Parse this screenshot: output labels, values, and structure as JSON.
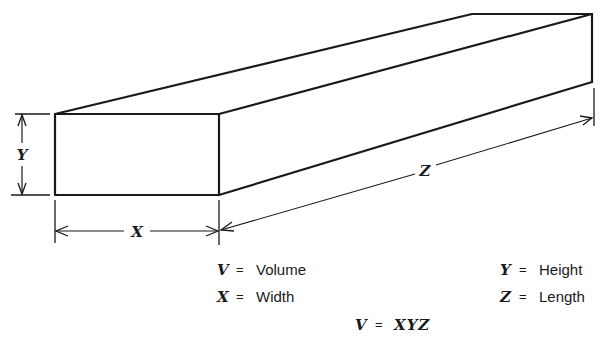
{
  "diagram": {
    "type": "isometric-rectangular-bar",
    "line_color": "#1a1a1a",
    "background": "#ffffff",
    "dimensions": {
      "width_label": "X",
      "height_label": "Y",
      "length_label": "Z"
    }
  },
  "legend": {
    "items": [
      {
        "symbol": "V",
        "equals": "=",
        "meaning": "Volume"
      },
      {
        "symbol": "X",
        "equals": "=",
        "meaning": "Width"
      },
      {
        "symbol": "Y",
        "equals": "=",
        "meaning": "Height"
      },
      {
        "symbol": "Z",
        "equals": "=",
        "meaning": "Length"
      }
    ],
    "formula": {
      "lhs": "V",
      "equals": "=",
      "rhs": "XYZ"
    }
  }
}
